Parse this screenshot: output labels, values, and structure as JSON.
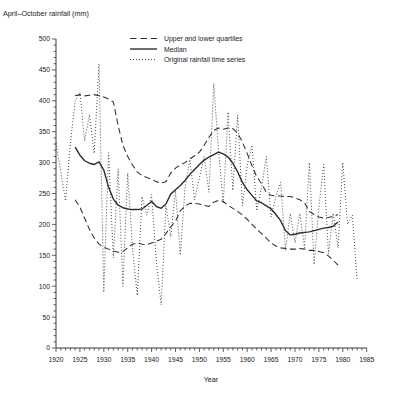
{
  "figure_title": "April–October rainfall (mm)",
  "chart_data": {
    "type": "line",
    "title": "April–October rainfall (mm)",
    "xlabel": "Year",
    "ylabel": "April–October rainfall (mm)",
    "xlim": [
      1920,
      1985
    ],
    "ylim": [
      0,
      500
    ],
    "x_tick_step": 5,
    "x_minor_tick_step": 1,
    "y_tick_step": 50,
    "y_minor_tick_step": 10,
    "grid": false,
    "line_color": "#2e2e2e",
    "legend_position": "top-center-inside",
    "legend": [
      "Upper and lower quartiles",
      "Median",
      "Original rainfall time series"
    ],
    "series": [
      {
        "name": "Original rainfall time series",
        "style": "dotted",
        "x_start": 1920,
        "x_step": 1,
        "values": [
          332,
          285,
          238,
          330,
          400,
          413,
          335,
          378,
          315,
          460,
          90,
          316,
          146,
          290,
          100,
          283,
          162,
          85,
          245,
          215,
          248,
          140,
          70,
          230,
          180,
          255,
          150,
          260,
          305,
          240,
          275,
          310,
          252,
          428,
          320,
          235,
          382,
          255,
          377,
          230,
          295,
          328,
          222,
          260,
          310,
          212,
          245,
          268,
          158,
          218,
          170,
          218,
          162,
          300,
          135,
          228,
          297,
          152,
          218,
          162,
          300,
          200,
          215,
          110
        ]
      },
      {
        "name": "Upper quartile",
        "legend_group": "Upper and lower quartiles",
        "style": "dashed",
        "x_start": 1924,
        "x_step": 1,
        "values": [
          408,
          410,
          408,
          409,
          410,
          408,
          406,
          403,
          398,
          360,
          328,
          310,
          296,
          285,
          279,
          276,
          273,
          269,
          267,
          269,
          283,
          291,
          296,
          300,
          306,
          311,
          317,
          328,
          341,
          352,
          356,
          354,
          356,
          355,
          348,
          333,
          315,
          295,
          277,
          266,
          252,
          247,
          246,
          246,
          245,
          245,
          243,
          240,
          235,
          221,
          216,
          212,
          210,
          211,
          213,
          216
        ]
      },
      {
        "name": "Lower quartile",
        "legend_group": "Upper and lower quartiles",
        "style": "dashed",
        "x_start": 1924,
        "x_step": 1,
        "values": [
          240,
          228,
          210,
          192,
          178,
          168,
          163,
          160,
          157,
          155,
          156,
          162,
          168,
          170,
          168,
          167,
          170,
          173,
          176,
          185,
          196,
          205,
          222,
          230,
          234,
          234,
          233,
          231,
          229,
          236,
          239,
          237,
          231,
          226,
          221,
          215,
          208,
          200,
          192,
          185,
          178,
          170,
          165,
          162,
          161,
          160,
          160,
          161,
          160,
          158,
          158,
          156,
          154,
          149,
          142,
          134
        ]
      },
      {
        "name": "Median",
        "style": "solid",
        "x_start": 1924,
        "x_step": 1,
        "values": [
          325,
          312,
          303,
          299,
          297,
          301,
          288,
          260,
          241,
          231,
          227,
          225,
          224,
          224,
          225,
          231,
          237,
          229,
          226,
          233,
          249,
          256,
          263,
          271,
          281,
          289,
          297,
          304,
          309,
          313,
          317,
          314,
          309,
          299,
          285,
          268,
          256,
          247,
          238,
          235,
          230,
          225,
          216,
          206,
          190,
          183,
          184,
          186,
          187,
          188,
          190,
          192,
          194,
          195,
          197,
          204
        ]
      }
    ]
  }
}
